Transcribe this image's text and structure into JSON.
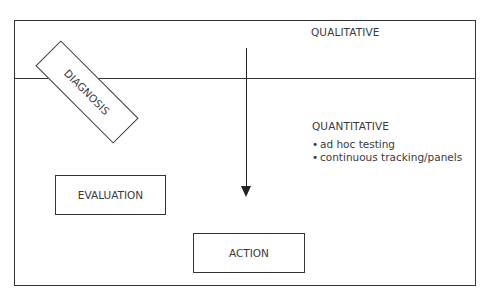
{
  "diagram": {
    "regions": {
      "top": {
        "label": "QUALITATIVE"
      },
      "bottom": {
        "label": "QUANTITATIVE",
        "items": [
          "ad hoc testing",
          "continuous tracking/panels"
        ]
      }
    },
    "boxes": {
      "diagnosis": "DIAGNOSIS",
      "evaluation": "EVALUATION",
      "action": "ACTION"
    },
    "bullet_glyph": "•",
    "colors": {
      "line": "#333333",
      "text": "#3a3a3a",
      "background": "#ffffff"
    }
  }
}
